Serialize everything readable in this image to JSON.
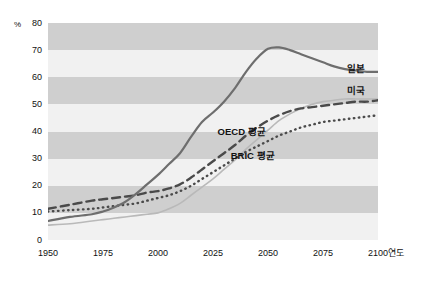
{
  "chart_data": {
    "type": "line",
    "title": "",
    "xlabel": "연도",
    "ylabel": "%",
    "xlim": [
      1950,
      2100
    ],
    "ylim": [
      0,
      80
    ],
    "grid": "horizontal-bands",
    "legend_position": "inline-right",
    "y_ticks": [
      "0",
      "10",
      "20",
      "30",
      "40",
      "50",
      "60",
      "70",
      "80"
    ],
    "y_tick_values": [
      0,
      10,
      20,
      30,
      40,
      50,
      60,
      70,
      80
    ],
    "x_ticks": [
      "1950",
      "1975",
      "2000",
      "2025",
      "2050",
      "2075",
      "2100"
    ],
    "x_tick_values": [
      1950,
      1975,
      2000,
      2025,
      2050,
      2075,
      2100
    ],
    "x": [
      1950,
      1960,
      1970,
      1975,
      1980,
      1985,
      1990,
      1995,
      2000,
      2005,
      2010,
      2015,
      2020,
      2025,
      2030,
      2035,
      2040,
      2045,
      2050,
      2055,
      2060,
      2065,
      2070,
      2075,
      2080,
      2085,
      2090,
      2095,
      2100
    ],
    "series": [
      {
        "name": "일본",
        "style": "solid",
        "color": "#6e6e6e",
        "width": 2.2,
        "label_x": 2090,
        "label_y": 64,
        "values": [
          7,
          8.5,
          9.5,
          10.5,
          12,
          14,
          17,
          20.5,
          24,
          28,
          32,
          38,
          43.5,
          47,
          51,
          56,
          62,
          67,
          70.5,
          71,
          70,
          68.5,
          67,
          65.5,
          64,
          63,
          62.5,
          62,
          62
        ]
      },
      {
        "name": "미국",
        "style": "solid",
        "color": "#b9b9b9",
        "width": 1.6,
        "label_x": 2090,
        "label_y": 56,
        "values": [
          5.5,
          6,
          7,
          7.5,
          8,
          8.5,
          9,
          9.5,
          10,
          11.5,
          13.5,
          16.5,
          19.5,
          22.5,
          26,
          29.5,
          33.5,
          37,
          40.5,
          44,
          46.5,
          48.5,
          50,
          51,
          51.5,
          52,
          52,
          52,
          52
        ]
      },
      {
        "name": "OECD 평균",
        "style": "dashed",
        "color": "#4a4a4a",
        "width": 2.4,
        "label_x": 2038,
        "label_y": 41,
        "values": [
          11.5,
          13,
          14.5,
          15,
          15.5,
          16,
          16.5,
          17.5,
          18,
          19,
          20.5,
          23,
          26,
          29,
          32,
          35,
          38.5,
          41.5,
          44,
          46,
          47.5,
          48.5,
          49,
          49.5,
          50,
          50.5,
          51,
          51,
          51.5
        ]
      },
      {
        "name": "BRIC 평균",
        "style": "dotted",
        "color": "#4a4a4a",
        "width": 2.4,
        "label_x": 2043,
        "label_y": 32,
        "values": [
          10.5,
          11,
          11.5,
          12,
          12.5,
          13,
          13.5,
          14.5,
          15.5,
          16.5,
          18,
          20,
          22.5,
          25,
          27.5,
          30,
          32.5,
          34.5,
          36.5,
          38.5,
          40,
          41.5,
          42.5,
          43.5,
          44,
          44.5,
          45,
          45.5,
          46
        ]
      }
    ]
  },
  "axes": {
    "unit_y": "%",
    "unit_x": "연도"
  }
}
